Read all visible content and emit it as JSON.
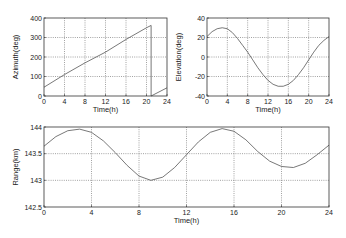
{
  "chart_data": [
    {
      "id": "azimuth",
      "type": "line",
      "title": "",
      "xlabel": "Time(h)",
      "ylabel": "Azimuth(deg)",
      "xlim": [
        0,
        24
      ],
      "ylim": [
        0,
        400
      ],
      "xticks": [
        0,
        4,
        8,
        12,
        16,
        20,
        24
      ],
      "yticks": [
        0,
        100,
        200,
        300,
        400
      ],
      "grid": true,
      "box": {
        "x": 44,
        "y": 18,
        "w": 123,
        "h": 78
      },
      "series": [
        {
          "name": "Azimuth",
          "segments": [
            {
              "x": [
                0,
                4,
                8,
                12,
                16,
                20,
                20.9
              ],
              "y": [
                45,
                110,
                170,
                225,
                290,
                350,
                362
              ]
            },
            {
              "x": [
                20.9,
                20.9
              ],
              "y": [
                362,
                0
              ]
            },
            {
              "x": [
                20.9,
                24
              ],
              "y": [
                0,
                42
              ]
            }
          ]
        }
      ]
    },
    {
      "id": "elevation",
      "type": "line",
      "title": "",
      "xlabel": "Time(h)",
      "ylabel": "Elevation(deg)",
      "xlim": [
        0,
        24
      ],
      "ylim": [
        -40,
        40
      ],
      "xticks": [
        0,
        4,
        8,
        12,
        16,
        20,
        24
      ],
      "yticks": [
        -40,
        -20,
        0,
        20,
        40
      ],
      "grid": true,
      "box": {
        "x": 207,
        "y": 18,
        "w": 122,
        "h": 78
      },
      "series": [
        {
          "name": "Elevation",
          "segments": [
            {
              "x": [
                0,
                1,
                2,
                3,
                4,
                5,
                6,
                7,
                8,
                9,
                10,
                11,
                12,
                13,
                14,
                15,
                16,
                17,
                18,
                19,
                20,
                21,
                22,
                23,
                24
              ],
              "y": [
                21,
                26,
                29,
                30,
                29,
                25,
                19,
                12,
                5,
                -3,
                -11,
                -18,
                -24,
                -28,
                -30,
                -30,
                -28,
                -24,
                -18,
                -11,
                -3,
                5,
                12,
                17,
                21
              ]
            }
          ]
        }
      ]
    },
    {
      "id": "range",
      "type": "line",
      "title": "",
      "xlabel": "Time(h)",
      "ylabel": "Range(km)",
      "xlim": [
        0,
        24
      ],
      "ylim": [
        142.5,
        144
      ],
      "xticks": [
        0,
        4,
        8,
        12,
        16,
        20,
        24
      ],
      "yticks": [
        142.5,
        143,
        143.5,
        144
      ],
      "grid": true,
      "box": {
        "x": 44,
        "y": 127,
        "w": 285,
        "h": 80
      },
      "series": [
        {
          "name": "Range",
          "segments": [
            {
              "x": [
                0,
                1,
                2,
                3,
                4,
                5,
                6,
                7,
                8,
                9,
                10,
                11,
                12,
                13,
                14,
                15,
                16,
                17,
                18,
                19,
                20,
                21,
                22,
                23,
                24
              ],
              "y": [
                143.64,
                143.82,
                143.93,
                143.96,
                143.9,
                143.74,
                143.52,
                143.28,
                143.08,
                143.0,
                143.06,
                143.24,
                143.48,
                143.72,
                143.9,
                143.97,
                143.92,
                143.76,
                143.54,
                143.36,
                143.26,
                143.24,
                143.32,
                143.48,
                143.66
              ]
            }
          ]
        }
      ]
    }
  ]
}
